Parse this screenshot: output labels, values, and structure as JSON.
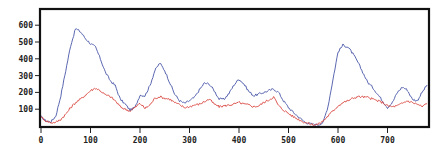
{
  "chart_data": {
    "type": "line",
    "title": "",
    "xlabel": "",
    "ylabel": "",
    "xlim": [
      0,
      783
    ],
    "ylim": [
      0,
      610
    ],
    "grid": false,
    "legend": null,
    "x_ticks": [
      0,
      100,
      200,
      300,
      400,
      500,
      600,
      700
    ],
    "x_tick_labels": [
      "0",
      "100",
      "200",
      "300",
      "400",
      "500",
      "600",
      "700"
    ],
    "y_ticks": [
      100,
      200,
      300,
      400,
      500,
      600
    ],
    "y_tick_labels": [
      "100",
      "200",
      "300",
      "400",
      "500",
      "600"
    ],
    "x": [
      0,
      10,
      20,
      30,
      40,
      50,
      60,
      70,
      80,
      90,
      100,
      110,
      120,
      130,
      140,
      150,
      160,
      170,
      180,
      190,
      200,
      210,
      220,
      230,
      240,
      250,
      260,
      270,
      280,
      290,
      300,
      310,
      320,
      330,
      340,
      350,
      360,
      370,
      380,
      390,
      400,
      410,
      420,
      430,
      440,
      450,
      460,
      470,
      480,
      490,
      500,
      510,
      520,
      530,
      540,
      550,
      560,
      570,
      580,
      590,
      600,
      610,
      620,
      630,
      640,
      650,
      660,
      670,
      680,
      690,
      700,
      710,
      720,
      730,
      740,
      750,
      760,
      770,
      780
    ],
    "series": [
      {
        "name": "blue",
        "color": "#4a57a8",
        "values": [
          55,
          30,
          25,
          60,
          180,
          330,
          480,
          580,
          560,
          520,
          490,
          470,
          400,
          320,
          270,
          240,
          160,
          130,
          95,
          110,
          185,
          180,
          240,
          330,
          375,
          330,
          260,
          190,
          150,
          135,
          150,
          170,
          215,
          255,
          250,
          210,
          160,
          160,
          195,
          245,
          280,
          250,
          205,
          180,
          190,
          200,
          210,
          220,
          200,
          150,
          110,
          80,
          55,
          30,
          15,
          10,
          8,
          20,
          120,
          280,
          440,
          482,
          470,
          430,
          380,
          320,
          260,
          230,
          190,
          150,
          110,
          140,
          200,
          232,
          215,
          160,
          150,
          200,
          244
        ]
      },
      {
        "name": "red",
        "color": "#d9463f",
        "values": [
          55,
          30,
          20,
          22,
          40,
          70,
          110,
          140,
          160,
          185,
          210,
          226,
          210,
          185,
          175,
          150,
          115,
          100,
          90,
          110,
          135,
          105,
          125,
          165,
          175,
          165,
          160,
          140,
          125,
          110,
          115,
          125,
          130,
          145,
          160,
          130,
          115,
          120,
          125,
          130,
          140,
          130,
          125,
          115,
          120,
          140,
          155,
          173,
          120,
          95,
          75,
          55,
          40,
          25,
          15,
          8,
          10,
          30,
          60,
          90,
          120,
          140,
          150,
          165,
          175,
          173,
          170,
          160,
          150,
          140,
          120,
          115,
          120,
          135,
          150,
          140,
          130,
          115,
          135
        ]
      }
    ]
  }
}
